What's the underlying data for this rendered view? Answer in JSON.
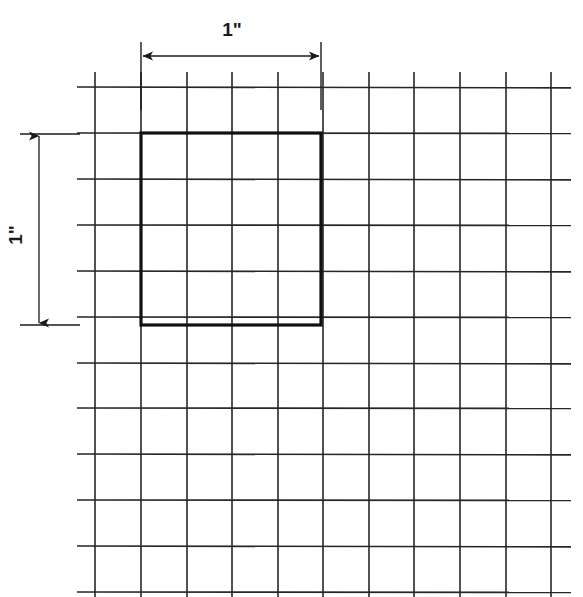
{
  "figure": {
    "background_color": "#ffffff",
    "line_color": "#262626",
    "thick_line_color": "#111111",
    "dimension_color": "#1a1a1a"
  },
  "labels": {
    "horizontal_dimension": "1\"",
    "vertical_dimension": "1\""
  },
  "chart_data": {
    "type": "diagram",
    "title": "",
    "grid": {
      "cell_size_px": 45.6,
      "cell_size_inches": 0.25,
      "origin_x": 95,
      "origin_y": 87,
      "vertical_line_x": [
        95,
        141,
        187,
        232,
        278,
        323,
        369,
        414,
        460,
        506,
        551
      ],
      "horizontal_line_y": [
        87,
        133,
        179,
        225,
        271,
        317,
        363,
        408,
        454,
        500,
        546,
        592
      ],
      "horizontal_extent_x": [
        77,
        571
      ],
      "vertical_extent_y": [
        72,
        597
      ],
      "vertical_count": 11,
      "horizontal_count": 12,
      "stroke_width": 1.6
    },
    "highlight_square": {
      "x": 141,
      "y": 133,
      "width": 180,
      "height": 192,
      "cells_wide": 4,
      "cells_tall": 4,
      "side_inches": 1,
      "stroke_width": 3.2
    },
    "dimensions": [
      {
        "name": "horizontal",
        "label": "1\"",
        "orientation": "horizontal",
        "line_y": 56,
        "from_x": 141,
        "to_x": 321,
        "extension_top_y": 42,
        "extension_bottom_y": 110,
        "text_x": 232,
        "text_y": 36
      },
      {
        "name": "vertical",
        "label": "1\"",
        "orientation": "vertical",
        "line_x": 39,
        "from_y": 134,
        "to_y": 325,
        "extension_left_x": 20,
        "extension_right_x": 80,
        "text_x": 22,
        "text_y": 235,
        "text_rotation": -90
      }
    ]
  }
}
